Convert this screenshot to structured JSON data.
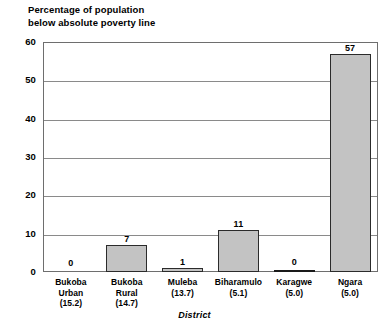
{
  "chart_data": {
    "type": "bar",
    "title": "Percentage of population\nbelow absolute poverty line",
    "xlabel": "District",
    "ylabel": "",
    "ylim": [
      0,
      60
    ],
    "yticks": [
      0,
      10,
      20,
      30,
      40,
      50,
      60
    ],
    "grid": true,
    "legend": "none",
    "categories": [
      "Bukoba\nUrban\n(15.2)",
      "Bukoba\nRural\n(14.7)",
      "Muleba\n(13.7)",
      "Biharamulo\n(5.1)",
      "Karagwe\n(5.0)",
      "Ngara\n(5.0)"
    ],
    "category_names": [
      "Bukoba Urban",
      "Bukoba Rural",
      "Muleba",
      "Biharamulo",
      "Karagwe",
      "Ngara"
    ],
    "category_parentheticals": [
      "15.2",
      "14.7",
      "13.7",
      "5.1",
      "5.0",
      "5.0"
    ],
    "values": [
      0,
      7,
      1,
      11,
      0,
      57
    ],
    "value_labels": [
      "0",
      "7",
      "1",
      "11",
      "0",
      "57"
    ],
    "colors": {
      "bar_fill": "#c3c3c3",
      "bar_border": "#2b2b2b",
      "gridline": "#8a8a8a",
      "frame": "#6e6e6e",
      "text": "#000000",
      "background": "#ffffff"
    }
  }
}
